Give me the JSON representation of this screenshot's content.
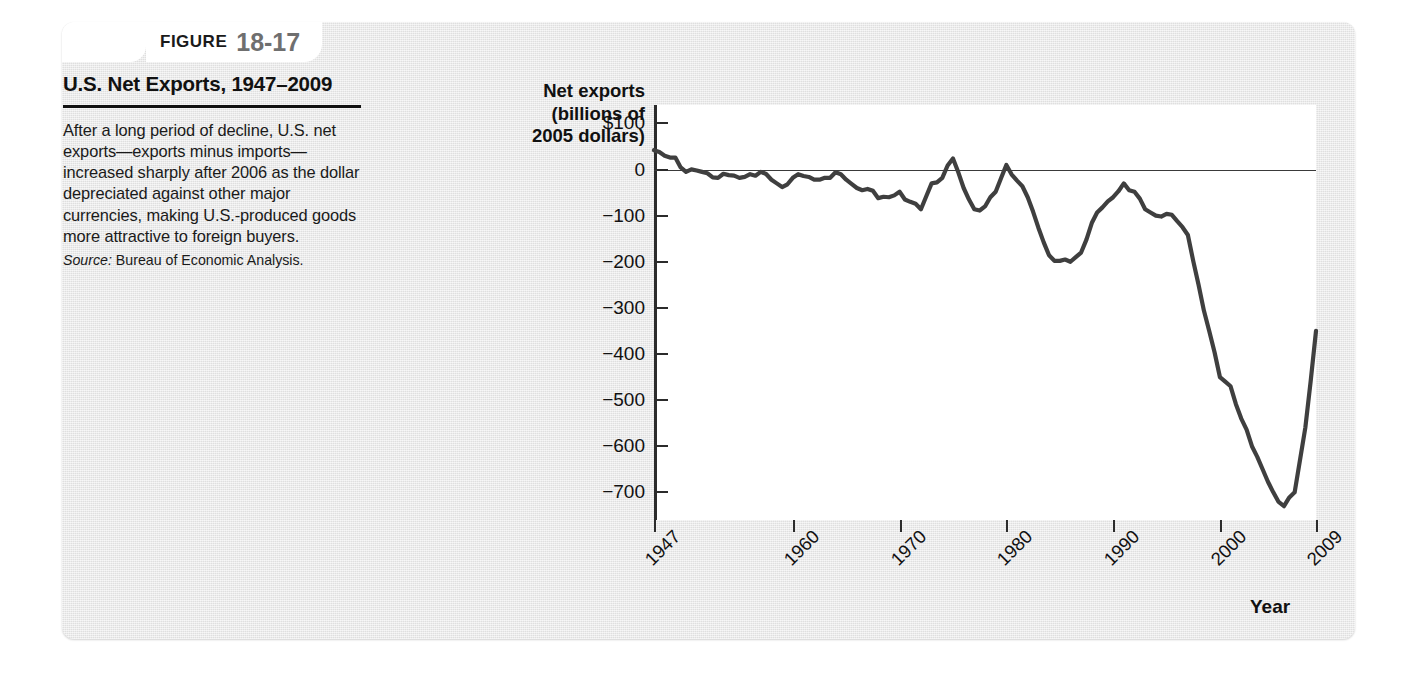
{
  "figure": {
    "label_word": "FIGURE",
    "number": "18-17",
    "title": "U.S. Net Exports, 1947–2009",
    "body": "After a long period of decline, U.S. net exports—exports minus imports—increased sharply after 2006 as the dollar depreciated against other major currencies, making U.S.-produced goods more attractive to foreign buyers.",
    "source_label": "Source:",
    "source_text": "Bureau of Economic Analysis.",
    "panel_color": "#e8e8e8",
    "number_color": "#6f6f6f",
    "line_color": "#3a3a3a"
  },
  "chart_data": {
    "type": "line",
    "title": "U.S. Net Exports, 1947–2009",
    "xlabel": "Year",
    "ylabel": "Net exports (billions of 2005 dollars)",
    "ylabel_lines": [
      "Net exports",
      "(billions of",
      "2005 dollars)"
    ],
    "xlim": [
      1947,
      2009
    ],
    "ylim": [
      -760,
      140
    ],
    "grid": false,
    "legend": null,
    "yticks": [
      100,
      0,
      -100,
      -200,
      -300,
      -400,
      -500,
      -600,
      -700
    ],
    "ytick_labels": [
      "$100",
      "0",
      "−100",
      "−200",
      "−300",
      "−400",
      "−500",
      "−600",
      "−700"
    ],
    "xticks": [
      1947,
      1960,
      1970,
      1980,
      1990,
      2000,
      2009
    ],
    "xtick_labels": [
      "1947",
      "1960",
      "1970",
      "1980",
      "1990",
      "2000",
      "2009"
    ],
    "zero_reference_line": 0,
    "series": [
      {
        "name": "U.S. net exports",
        "color": "#3f3f3f",
        "x": [
          1947,
          1948,
          1949,
          1950,
          1951,
          1952,
          1953,
          1954,
          1955,
          1956,
          1957,
          1958,
          1959,
          1960,
          1961,
          1962,
          1963,
          1964,
          1965,
          1966,
          1967,
          1968,
          1969,
          1970,
          1971,
          1972,
          1973,
          1974,
          1975,
          1976,
          1977,
          1978,
          1979,
          1980,
          1981,
          1982,
          1983,
          1984,
          1985,
          1986,
          1987,
          1988,
          1989,
          1990,
          1991,
          1992,
          1993,
          1994,
          1995,
          1996,
          1997,
          1998,
          1999,
          2000,
          2001,
          2002,
          2003,
          2004,
          2005,
          2006,
          2007,
          2008,
          2009
        ],
        "y": [
          42,
          30,
          26,
          -5,
          -2,
          -8,
          -18,
          -12,
          -18,
          -10,
          -5,
          -22,
          -38,
          -18,
          -14,
          -22,
          -18,
          -6,
          -22,
          -40,
          -42,
          -62,
          -60,
          -48,
          -70,
          -86,
          -30,
          -18,
          24,
          -40,
          -86,
          -80,
          -48,
          10,
          -24,
          -60,
          -126,
          -186,
          -198,
          -200,
          -180,
          -116,
          -82,
          -60,
          -30,
          -48,
          -86,
          -100,
          -96,
          -112,
          -142,
          -250,
          -350,
          -450,
          -470,
          -540,
          -600,
          -650,
          -700,
          -730,
          -700,
          -560,
          -350
        ]
      }
    ],
    "annotations": []
  }
}
